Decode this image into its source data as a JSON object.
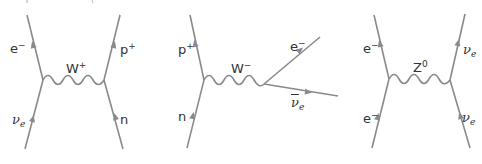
{
  "figure": {
    "line_color": "#8a8a8a",
    "label_color": "#333333",
    "diagrams": [
      {
        "name": "charged-current neutrino scattering",
        "boson": {
          "base": "W",
          "sup": "+"
        },
        "particles": {
          "top_left": {
            "base": "e",
            "sup": "−"
          },
          "bottom_left": {
            "base": "ν",
            "sub": "e"
          },
          "top_right": {
            "base": "p",
            "sup": "+"
          },
          "bottom_right": {
            "base": "n"
          }
        }
      },
      {
        "name": "beta decay",
        "boson": {
          "base": "W",
          "sup": "−"
        },
        "particles": {
          "top_left": {
            "base": "p",
            "sup": "+"
          },
          "bottom_left": {
            "base": "n"
          },
          "out_upper": {
            "base": "e",
            "sup": "−"
          },
          "out_lower": {
            "base": "ν",
            "sub": "e",
            "bar": true
          }
        }
      },
      {
        "name": "neutral-current scattering",
        "boson": {
          "base": "Z",
          "sup": "0"
        },
        "particles": {
          "top_left": {
            "base": "e",
            "sup": "−"
          },
          "bottom_left": {
            "base": "e",
            "sup": "−"
          },
          "top_right": {
            "base": "ν",
            "sub": "e"
          },
          "bottom_right": {
            "base": "ν",
            "sub": "e"
          }
        }
      }
    ]
  }
}
